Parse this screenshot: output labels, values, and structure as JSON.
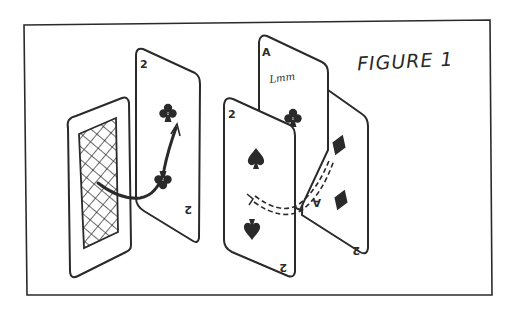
{
  "figure": {
    "caption": "FIGURE 1",
    "style": "hand-drawn pencil sketch",
    "ink_color": "#2a2a2a",
    "background": "#ffffff"
  },
  "cards": [
    {
      "id": "back-card",
      "face": "back",
      "pattern": "crosshatch"
    },
    {
      "id": "two-of-clubs",
      "rank": "2",
      "suit": "clubs",
      "corner_top": "2",
      "corner_bottom": "2"
    },
    {
      "id": "ace-of-clubs",
      "rank": "A",
      "suit": "clubs",
      "corner_top": "A",
      "signature": "Lmm"
    },
    {
      "id": "two-of-spades",
      "rank": "2",
      "suit": "spades",
      "corner_top": "2",
      "corner_bottom": "2"
    },
    {
      "id": "two-of-diamonds",
      "rank": "A",
      "suit": "diamonds",
      "corner_top": "A",
      "corner_bottom": "2"
    }
  ],
  "arrows": [
    {
      "id": "solid-transfer-arrow",
      "style": "solid",
      "from": "back-card",
      "to": "two-of-clubs"
    },
    {
      "id": "dashed-transfer-arrow",
      "style": "dashed",
      "from": "two-of-spades",
      "to": "two-of-diamonds"
    }
  ]
}
